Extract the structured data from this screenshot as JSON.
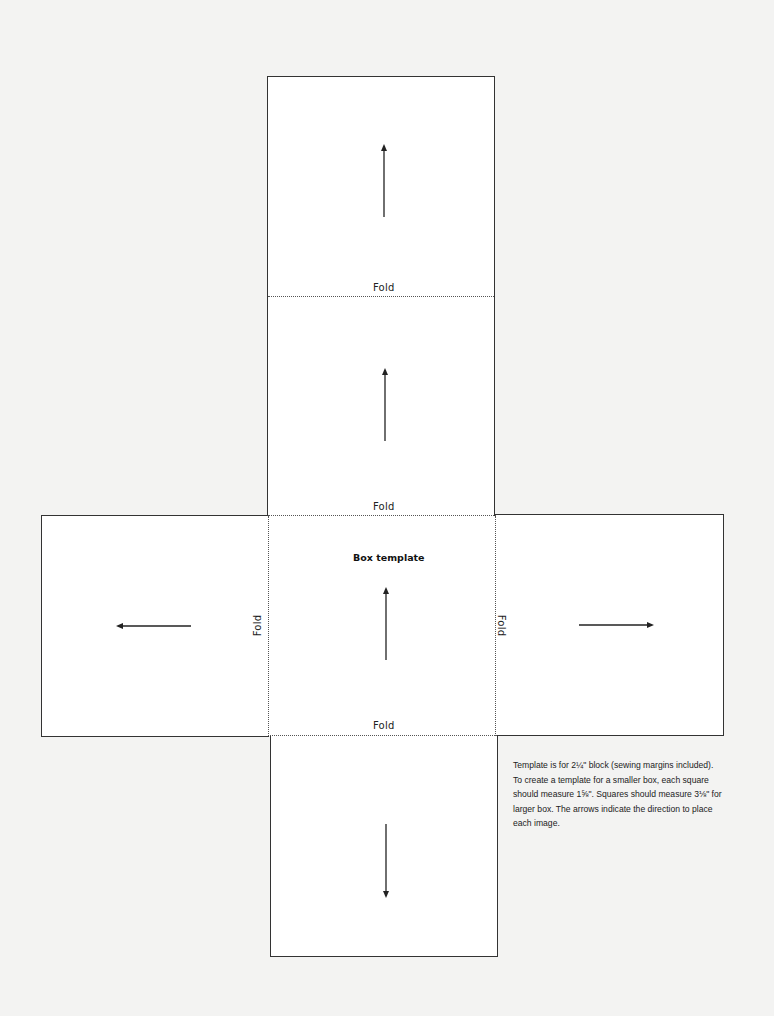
{
  "template": {
    "title": "Box template",
    "fold_label": "Fold",
    "folds": {
      "top": "Fold",
      "upper_middle": "Fold",
      "left": "Fold",
      "right": "Fold",
      "bottom": "Fold"
    },
    "squares": [
      "top",
      "upper",
      "left",
      "center",
      "right",
      "bottom"
    ],
    "arrows": {
      "top": "up",
      "upper": "up",
      "left": "left",
      "center": "up",
      "right": "right",
      "bottom": "down"
    },
    "note": "Template is for 2¼\" block (sewing margins included). To create a template for a smaller box, each square should measure 1⅝\". Squares should measure 3⅛\" for larger box. The arrows indicate the direction to place each image."
  },
  "colors": {
    "background": "#f3f3f2",
    "paper": "#ffffff",
    "line": "#333333"
  }
}
